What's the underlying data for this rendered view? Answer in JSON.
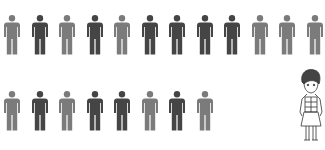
{
  "colors": {
    "light": "#7b7b7b",
    "dark": "#454545",
    "background": "#ffffff"
  },
  "rows": [
    {
      "figures": [
        "light",
        "dark",
        "light",
        "dark",
        "light",
        "dark",
        "dark",
        "dark",
        "dark",
        "light",
        "light",
        "light"
      ]
    },
    {
      "figures": [
        "light",
        "dark",
        "light",
        "dark",
        "dark",
        "light",
        "dark",
        "light"
      ]
    }
  ],
  "illustration": {
    "subject": "cartoon girl"
  }
}
